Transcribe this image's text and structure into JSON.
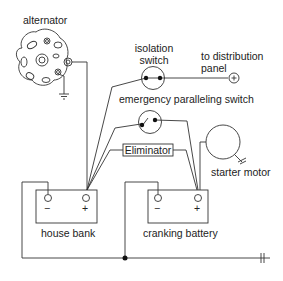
{
  "diagram": {
    "labels": {
      "alternator": "alternator",
      "isolation_switch_line1": "isolation",
      "isolation_switch_line2": "switch",
      "distribution_line1": "to distribution",
      "distribution_line2": "panel",
      "emergency_switch": "emergency paralleling switch",
      "eliminator": "Eliminator",
      "starter_motor": "starter motor",
      "house_bank": "house bank",
      "cranking_battery": "cranking battery",
      "minus": "−",
      "plus": "+"
    }
  }
}
